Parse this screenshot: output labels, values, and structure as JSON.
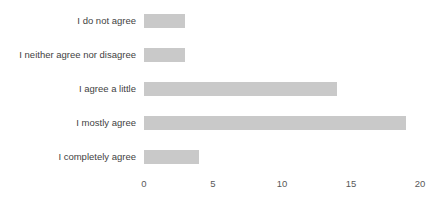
{
  "chart_data": {
    "type": "bar",
    "orientation": "horizontal",
    "title": "",
    "subtitle": "",
    "xlabel": "",
    "ylabel": "",
    "categories": [
      "I do not agree",
      "I neither agree nor disagree",
      "I agree a little",
      "I mostly agree",
      "I completely agree"
    ],
    "values": [
      3,
      3,
      14,
      19,
      4
    ],
    "xlim": [
      0,
      20
    ],
    "xticks": [
      0,
      5,
      10,
      15,
      20
    ],
    "xtick_labels": [
      "0",
      "5",
      "10",
      "15",
      "20"
    ],
    "grid": false,
    "legend": false,
    "legend_position": "none",
    "bar_color": "#c9c9c9",
    "label_color": "#3f3f3f",
    "tick_color": "#595959",
    "background_color": "#ffffff"
  }
}
